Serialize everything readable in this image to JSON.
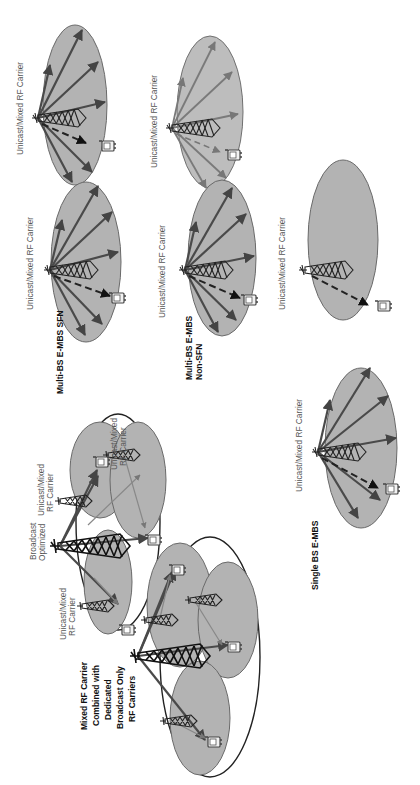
{
  "diagram": {
    "orientation": "rotated 90° counter-clockwise",
    "colors": {
      "cell_fill": "#b3b3b3",
      "cell_stroke": "#6a6a6a",
      "ray": "#4a4a4a",
      "outline": "#222222",
      "label": "#555555",
      "caption": "#111111"
    },
    "scenarios": [
      {
        "id": "multi-bs-sfn",
        "caption": "Multi-BS E-MBS SFN",
        "cells": [
          {
            "label": "Unicast/Mixed RF Carrier",
            "has_rays": true
          },
          {
            "label": "Unicast/Mixed RF Carrier",
            "has_rays": true
          }
        ]
      },
      {
        "id": "multi-bs-non-sfn",
        "caption_line1": "Multi-BS E-MBS",
        "caption_line2": "Non-SFN",
        "cells": [
          {
            "label": "Unicast/Mixed RF Carrier",
            "has_rays": true,
            "faded": true
          },
          {
            "label": "Unicast/Mixed RF Carrier",
            "has_rays": true
          }
        ]
      },
      {
        "id": "single-bs",
        "caption": "Single BS E-MBS",
        "cells": [
          {
            "label": "Unicast/Mixed RF Carrier",
            "has_rays": false
          },
          {
            "label": "Unicast/Mixed RF Carrier",
            "has_rays": true
          }
        ]
      },
      {
        "id": "mixed-broadcast",
        "caption_lines": [
          "Mixed RF Carrier",
          "Combined with",
          "Dedicated",
          "Broadcast Only",
          "RF Carriers"
        ],
        "labels": {
          "broadcast_line1": "Broadcast",
          "broadcast_line2": "Optimized",
          "unicast_a_line1": "Unicast/Mixed",
          "unicast_a_line2": "RF Carrier",
          "unicast_b_line1": "Unicast/Mixed",
          "unicast_b_line2": "RF Carrier",
          "unicast_c_line1": "Unicast/Mixed",
          "unicast_c_line2": "RF Carrier"
        }
      }
    ]
  }
}
